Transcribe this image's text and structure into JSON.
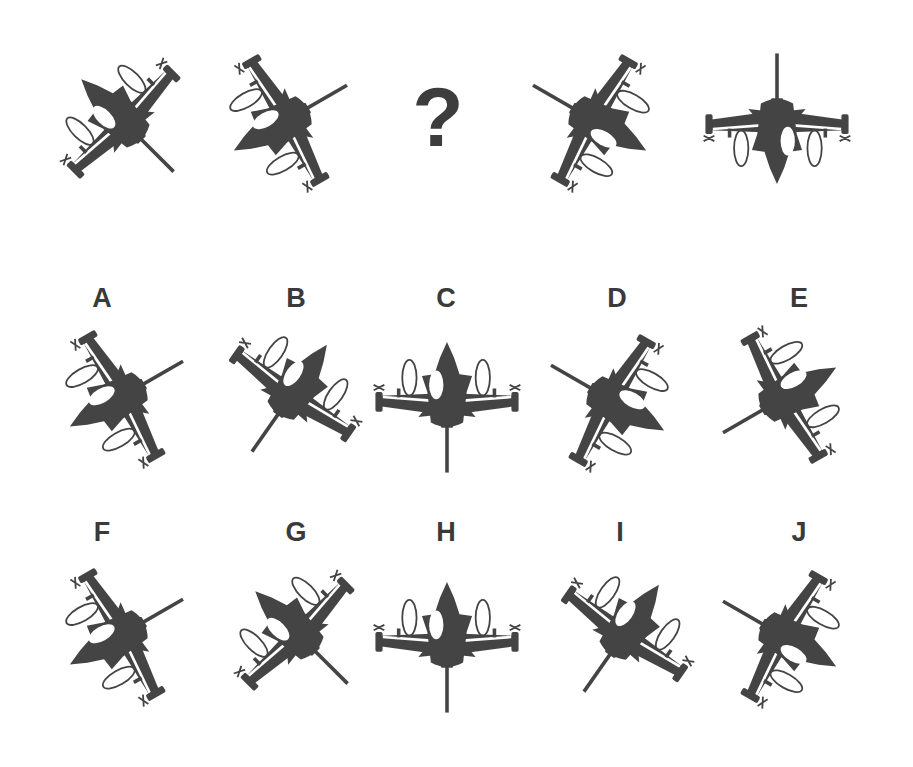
{
  "puzzle": {
    "type": "sequence-completion",
    "sequence": [
      {
        "id": "s1",
        "kind": "jet",
        "rotation": 135,
        "mirror": false
      },
      {
        "id": "s2",
        "kind": "jet",
        "rotation": 60,
        "mirror": true
      },
      {
        "id": "s3",
        "kind": "missing",
        "text": "?"
      },
      {
        "id": "s4",
        "kind": "jet",
        "rotation": -60,
        "mirror": true
      },
      {
        "id": "s5",
        "kind": "jet",
        "rotation": 0,
        "mirror": false
      }
    ],
    "options": [
      {
        "label": "A",
        "rotation": 60,
        "mirror": true
      },
      {
        "label": "B",
        "rotation": -145,
        "mirror": false
      },
      {
        "label": "C",
        "rotation": 180,
        "mirror": false
      },
      {
        "label": "D",
        "rotation": -60,
        "mirror": false
      },
      {
        "label": "E",
        "rotation": -120,
        "mirror": false
      },
      {
        "label": "F",
        "rotation": 60,
        "mirror": true
      },
      {
        "label": "G",
        "rotation": 135,
        "mirror": false
      },
      {
        "label": "H",
        "rotation": 180,
        "mirror": false
      },
      {
        "label": "I",
        "rotation": -145,
        "mirror": false
      },
      {
        "label": "J",
        "rotation": -60,
        "mirror": true
      }
    ],
    "colors": {
      "silhouette": "#444444",
      "label": "#3a3a3a",
      "background": "#ffffff"
    }
  }
}
